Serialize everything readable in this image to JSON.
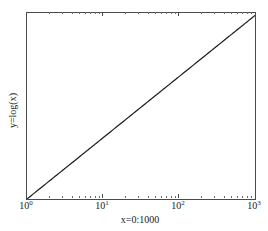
{
  "chart_data": {
    "type": "line",
    "title": "",
    "xlabel": "x=0:1000",
    "ylabel": "y=log(x)",
    "xscale": "log",
    "yscale": "linear",
    "xlim": [
      1,
      1000
    ],
    "ylim": [
      0,
      7
    ],
    "grid": false,
    "legend": null,
    "xtick_labels": [
      "10",
      "10",
      "10",
      "10"
    ],
    "xtick_exponents": [
      "0",
      "1",
      "2",
      "3"
    ],
    "xtick_values": [
      1,
      10,
      100,
      1000
    ],
    "ytick_labels": [
      "0",
      "1",
      "2",
      "3",
      "4",
      "5",
      "6",
      "7"
    ],
    "ytick_values": [
      0,
      1,
      2,
      3,
      4,
      5,
      6,
      7
    ],
    "series": [
      {
        "name": "y=log(x)",
        "color": "#1a1a1a",
        "linewidth": 1,
        "x": [
          1,
          2,
          3,
          4,
          5,
          6,
          7,
          8,
          9,
          10,
          20,
          30,
          40,
          50,
          60,
          70,
          80,
          90,
          100,
          200,
          300,
          400,
          500,
          600,
          700,
          800,
          900,
          1000
        ],
        "y": [
          0,
          0.693,
          1.099,
          1.386,
          1.609,
          1.792,
          1.946,
          2.079,
          2.197,
          2.303,
          2.996,
          3.401,
          3.689,
          3.912,
          4.094,
          4.248,
          4.382,
          4.5,
          4.605,
          5.298,
          5.704,
          5.991,
          6.215,
          6.397,
          6.551,
          6.685,
          6.802,
          6.908
        ]
      }
    ]
  },
  "axes": {
    "y_label_text": "y=log(x)",
    "x_label_text": "x=0:1000"
  }
}
